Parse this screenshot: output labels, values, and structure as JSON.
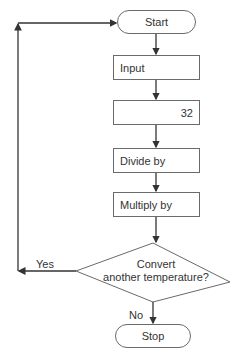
{
  "flowchart": {
    "start": "Start",
    "input": "Input",
    "subtract_box": "32",
    "divide_box": "Divide by",
    "multiply_box": "Multiply by",
    "decision": {
      "line1": "Convert",
      "line2": "another temperature?"
    },
    "yes_label": "Yes",
    "no_label": "No",
    "stop": "Stop"
  },
  "colors": {
    "stroke": "#6a6a6a",
    "arrow": "#333333",
    "text": "#333333"
  }
}
